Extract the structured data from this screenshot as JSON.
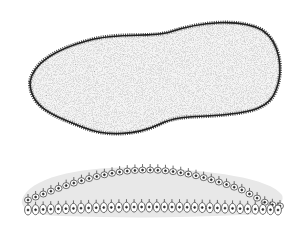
{
  "figure": {
    "upper_specimen": {
      "fill": "#9a9a9a",
      "outline": "#222222"
    },
    "lower_specimen": {
      "fill": "#e6e6e6",
      "outline": "#333333",
      "cell_count_top": 34,
      "cell_count_bottom": 34
    }
  }
}
